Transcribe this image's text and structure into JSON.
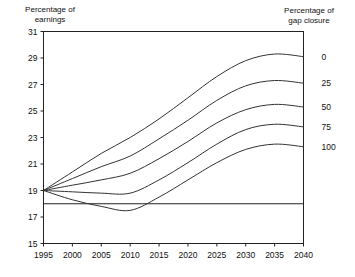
{
  "headers": {
    "left": "Percentage of\nearnings",
    "left_line1": "Percentage of",
    "left_line2": "earnings",
    "right_line1": "Percentage of",
    "right_line2": "gap closure"
  },
  "chart_data": {
    "type": "line",
    "title": "",
    "xlabel": "",
    "ylabel": "Percentage of earnings",
    "legend_title": "Percentage of gap closure",
    "legend_position": "right",
    "grid": false,
    "xlim": [
      1995,
      2040
    ],
    "ylim": [
      15,
      31
    ],
    "xticks": [
      1995,
      2000,
      2005,
      2010,
      2015,
      2020,
      2025,
      2030,
      2035,
      2040
    ],
    "yticks": [
      15,
      17,
      19,
      21,
      23,
      25,
      27,
      29,
      31
    ],
    "xtick_labels": [
      "1995",
      "2000",
      "2005",
      "2010",
      "2015",
      "2020",
      "2025",
      "2030",
      "2035",
      "2040"
    ],
    "ytick_labels": [
      "15",
      "17",
      "19",
      "21",
      "23",
      "25",
      "27",
      "29",
      "31"
    ],
    "reference_line": {
      "y": 18,
      "label": ""
    },
    "x": [
      1995,
      2000,
      2005,
      2010,
      2015,
      2020,
      2025,
      2030,
      2035,
      2040
    ],
    "series": [
      {
        "name": "0",
        "label": "0",
        "values": [
          19.0,
          20.4,
          21.8,
          23.0,
          24.4,
          26.0,
          27.6,
          28.8,
          29.3,
          29.1
        ]
      },
      {
        "name": "25",
        "label": "25",
        "values": [
          19.0,
          19.9,
          20.8,
          21.6,
          22.9,
          24.3,
          25.8,
          26.9,
          27.3,
          27.1
        ]
      },
      {
        "name": "50",
        "label": "50",
        "values": [
          19.0,
          19.4,
          19.8,
          20.3,
          21.4,
          22.7,
          24.1,
          25.1,
          25.5,
          25.3
        ]
      },
      {
        "name": "75",
        "label": "75",
        "values": [
          19.0,
          18.9,
          18.8,
          18.8,
          19.8,
          21.1,
          22.5,
          23.6,
          24.0,
          23.8
        ]
      },
      {
        "name": "100",
        "label": "100",
        "values": [
          19.0,
          18.3,
          17.8,
          17.5,
          18.5,
          19.8,
          21.1,
          22.1,
          22.5,
          22.3
        ]
      }
    ]
  }
}
